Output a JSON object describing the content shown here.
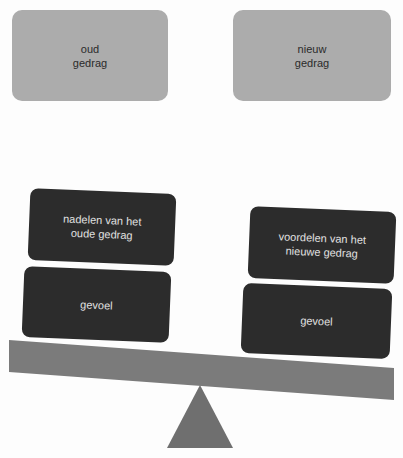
{
  "diagram": {
    "type": "balance-scale",
    "colors": {
      "top_box_fill": "#acacac",
      "top_box_text": "#2a2a2a",
      "weight_box_fill": "#2c2c2c",
      "weight_box_text": "#e2e2e2",
      "beam_fill": "#7b7b7b",
      "fulcrum_fill": "#6f6f6f"
    },
    "top_boxes": {
      "left": {
        "label": "oud\ngedrag"
      },
      "right": {
        "label": "nieuw\ngedrag"
      }
    },
    "left_pan": {
      "items": [
        {
          "label": "nadelen van het\noude gedrag"
        },
        {
          "label": "gevoel"
        }
      ]
    },
    "right_pan": {
      "items": [
        {
          "label": "voordelen van het\nnieuwe gedrag"
        },
        {
          "label": "gevoel"
        }
      ]
    }
  }
}
